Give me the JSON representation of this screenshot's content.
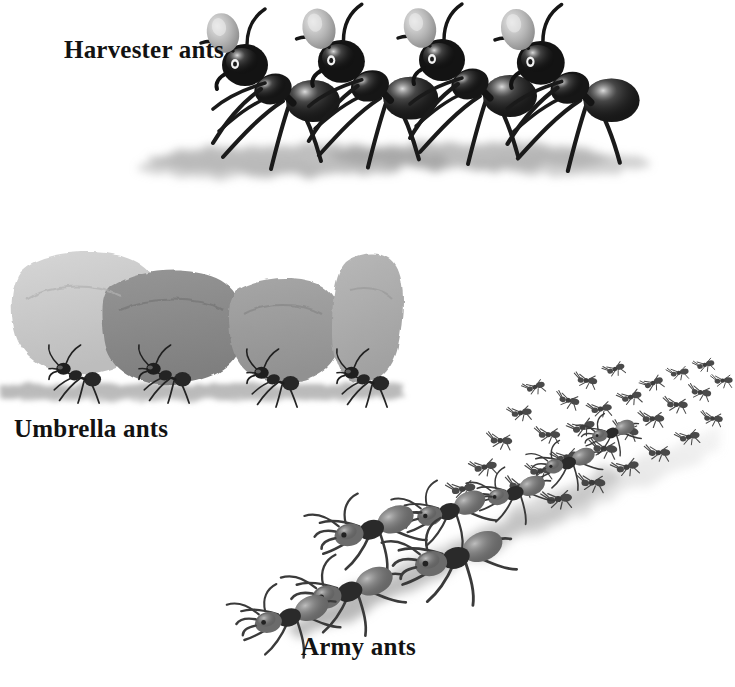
{
  "page": {
    "kind": "illustration",
    "medium": "grayscale watercolor and ink wash",
    "background_color": "#ffffff",
    "width": 735,
    "height": 687
  },
  "labels": {
    "harvester": "Harvester ants",
    "umbrella": "Umbrella ants",
    "army": "Army ants"
  },
  "palette": {
    "ink_black": "#141414",
    "body_dark": "#2a2a2a",
    "body_mid": "#6f6f6f",
    "body_light": "#9b9b9b",
    "seed_gray": "#b4b4b4",
    "ground_wash": "#a9a9a9",
    "trail_wash": "#b8b8b8",
    "leaf_light": "#cacaca",
    "leaf_dark": "#8a8a8a",
    "leaf_mid": "#9c9c9c",
    "leaf_pale": "#aeaeae",
    "label_color": "#121212"
  },
  "scenes": {
    "harvester": {
      "name": "Harvester ants",
      "description": "Four large black harvester ants in side profile walking to the right, each carrying a pale seed above its head",
      "ant_count": 4,
      "carried_item": "seed",
      "carried_item_color": "#b4b4b4",
      "ants": [
        {
          "x": 275,
          "y": 95,
          "scale": 1.0,
          "body_color": "#1b1b1b",
          "seed": true
        },
        {
          "x": 370,
          "y": 92,
          "scale": 1.02,
          "body_color": "#1f1f1f",
          "seed": true
        },
        {
          "x": 470,
          "y": 90,
          "scale": 1.0,
          "body_color": "#1b1b1b",
          "seed": true
        },
        {
          "x": 570,
          "y": 94,
          "scale": 1.04,
          "body_color": "#1f1f1f",
          "seed": true
        }
      ],
      "ground": {
        "x": 175,
        "y": 150,
        "width": 470,
        "height": 40,
        "color": "#a9a9a9"
      }
    },
    "umbrella": {
      "name": "Umbrella ants",
      "description": "Four leafcutter ants in side profile carrying large cut leaf fragments held overhead like umbrellas",
      "ant_count": 4,
      "carried_item": "leaf fragment",
      "leaves": [
        {
          "x": 20,
          "y": 265,
          "width": 140,
          "height": 110,
          "color": "#cacaca"
        },
        {
          "x": 108,
          "y": 278,
          "width": 130,
          "height": 100,
          "color": "#8a8a8a"
        },
        {
          "x": 232,
          "y": 288,
          "width": 118,
          "height": 95,
          "color": "#9c9c9c"
        },
        {
          "x": 340,
          "y": 255,
          "width": 62,
          "height": 130,
          "color": "#aeaeae"
        }
      ],
      "ants": [
        {
          "x": 60,
          "y": 378,
          "scale": 0.66,
          "body_color": "#2a2a2a"
        },
        {
          "x": 150,
          "y": 378,
          "scale": 0.66,
          "body_color": "#2a2a2a"
        },
        {
          "x": 252,
          "y": 382,
          "scale": 0.66,
          "body_color": "#2a2a2a"
        },
        {
          "x": 340,
          "y": 382,
          "scale": 0.66,
          "body_color": "#2a2a2a"
        }
      ],
      "ground": {
        "x": 0,
        "y": 392,
        "width": 405,
        "height": 22,
        "color": "#a9a9a9"
      }
    },
    "army": {
      "name": "Army ants",
      "description": "A dense diagonal marching column of army ants streaming from the lower left to the upper right, with large detailed ants in the foreground fading into a swarm in the distance",
      "direction": "lower-left to upper-right",
      "foreground_ant_count": 6,
      "swarm_ant_count": 46,
      "trail": {
        "from_x": 300,
        "from_y": 620,
        "to_x": 700,
        "to_y": 390,
        "color": "#b8b8b8"
      },
      "foreground_ants": [
        {
          "x": 345,
          "y": 585,
          "scale": 0.82,
          "body_color": "#555555",
          "head_color": "#262626"
        },
        {
          "x": 368,
          "y": 530,
          "scale": 0.88,
          "body_color": "#6a6a6a",
          "head_color": "#2b2b2b"
        },
        {
          "x": 455,
          "y": 555,
          "scale": 0.95,
          "body_color": "#6f6f6f",
          "head_color": "#242424"
        },
        {
          "x": 500,
          "y": 490,
          "scale": 0.72,
          "body_color": "#767676",
          "head_color": "#2f2f2f"
        },
        {
          "x": 565,
          "y": 462,
          "scale": 0.62,
          "body_color": "#7d7d7d",
          "head_color": "#333333"
        },
        {
          "x": 610,
          "y": 432,
          "scale": 0.52,
          "body_color": "#6b6b6b",
          "head_color": "#2d2d2d"
        }
      ]
    }
  }
}
